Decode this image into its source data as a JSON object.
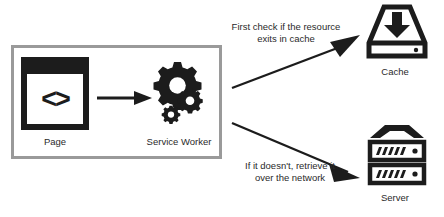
{
  "diagram": {
    "colors": {
      "ink": "#1c1c1c",
      "border": "#9a9a9a",
      "background": "#ffffff",
      "text": "#2a2a2a"
    },
    "client_group": {
      "nodes": [
        {
          "id": "page",
          "label": "Page",
          "icon": "browser-window-code-icon",
          "glyph": "<>"
        },
        {
          "id": "service-worker",
          "label": "Service Worker",
          "icon": "gears-icon"
        }
      ],
      "internal_edge": {
        "from": "page",
        "to": "service-worker",
        "style": "solid-arrow",
        "label": ""
      }
    },
    "remote_nodes": [
      {
        "id": "cache",
        "label": "Cache",
        "icon": "hard-drive-download-icon"
      },
      {
        "id": "server",
        "label": "Server",
        "icon": "server-rack-icon"
      }
    ],
    "edges": [
      {
        "id": "edge-cache",
        "from": "service-worker",
        "to": "cache",
        "caption_line_1": "First check if the resource",
        "caption_line_2": "exits in cache",
        "direction": "up-right"
      },
      {
        "id": "edge-server",
        "from": "service-worker",
        "to": "server",
        "caption_line_1": "If it doesn't, retrieve it",
        "caption_line_2": "over the network",
        "direction": "down-right"
      }
    ]
  }
}
